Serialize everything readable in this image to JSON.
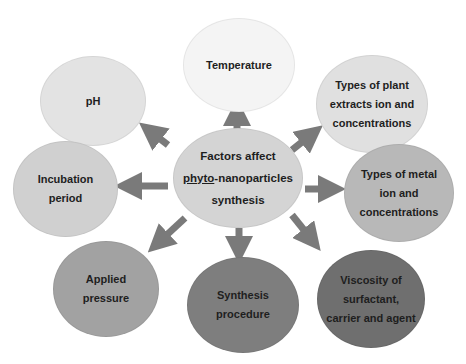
{
  "diagram": {
    "center": {
      "line1": "Factors affect",
      "line2_underlined": "phyto",
      "line2_rest": "-nanoparticles",
      "line3": "synthesis",
      "fill": "#d4d4d4"
    },
    "factors": [
      {
        "id": "temperature",
        "lines": [
          "Temperature"
        ],
        "fill": "#f4f4f4"
      },
      {
        "id": "plant-extracts",
        "lines": [
          "Types of plant",
          "extracts ion and",
          "concentrations"
        ],
        "fill": "#e0e0e0"
      },
      {
        "id": "metal-ion",
        "lines": [
          "Types of metal",
          "ion and",
          "concentrations"
        ],
        "fill": "#b8b8b8"
      },
      {
        "id": "viscosity",
        "lines": [
          "Viscosity of",
          "surfactant,",
          "carrier and agent"
        ],
        "fill": "#6f6f6f"
      },
      {
        "id": "synthesis-procedure",
        "lines": [
          "Synthesis",
          "procedure"
        ],
        "fill": "#7e7e7e"
      },
      {
        "id": "applied-pressure",
        "lines": [
          "Applied",
          "pressure"
        ],
        "fill": "#a2a2a2"
      },
      {
        "id": "incubation-period",
        "lines": [
          "Incubation",
          "period"
        ],
        "fill": "#d0d0d0"
      },
      {
        "id": "ph",
        "lines": [
          "pH"
        ],
        "fill": "#e3e3e3"
      }
    ],
    "arrow_color": "#7a7a7a"
  }
}
